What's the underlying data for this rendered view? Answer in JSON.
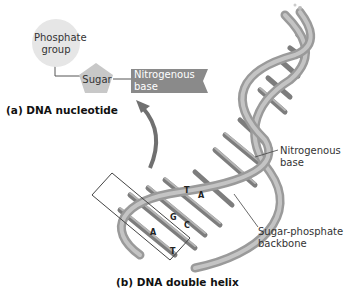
{
  "nucleotide": {
    "phosphate_label": "Phosphate group",
    "phosphate_line1": "Phosphate",
    "phosphate_line2": "group",
    "sugar_label": "Sugar",
    "base_line1": "Nitrogenous",
    "base_line2": "base",
    "caption": "(a) DNA nucleotide"
  },
  "helix": {
    "base_label_line1": "Nitrogenous",
    "base_label_line2": "base",
    "backbone_label_line1": "Sugar-phosphate",
    "backbone_label_line2": "backbone",
    "pairs": [
      "T",
      "A",
      "G",
      "C",
      "A",
      "T"
    ],
    "caption": "(b) DNA double helix"
  },
  "colors": {
    "phosphate": "#e6e6e6",
    "sugar": "#c8c8c8",
    "base": "#8a8a8a",
    "strand": "#a9a9a9",
    "arrow": "#707070"
  }
}
